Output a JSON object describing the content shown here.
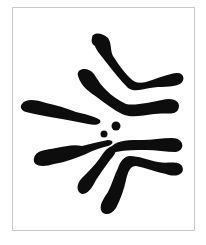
{
  "image": {
    "subject": "chromosome illustration",
    "description": "Black chromosome shapes radiating around two small central dots inside a thin gray frame",
    "colors": {
      "background": "#ffffff",
      "frame": "#c8c8c8",
      "chromosomes": "#0d0d0d"
    },
    "elements": {
      "chromosome_count": 7,
      "center_dot_count": 2
    }
  }
}
